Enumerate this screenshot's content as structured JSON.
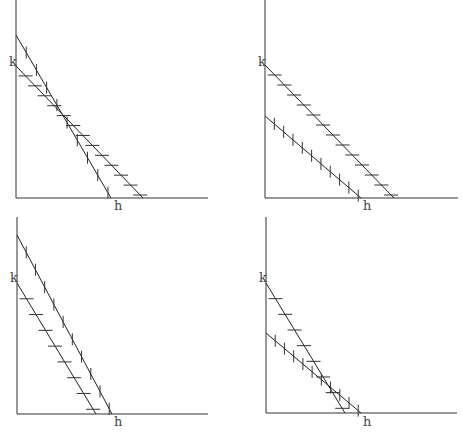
{
  "figure": {
    "colors": {
      "background": "#ffffff",
      "axis": "#333333",
      "line": "#222222",
      "label": "#444444"
    },
    "panels": [
      {
        "id": "top-left",
        "axes": {
          "origin": [
            16,
            198
          ],
          "y_top": 0,
          "x_right": 208
        },
        "labels": {
          "k": {
            "text": "k",
            "pos": [
              9,
              66
            ]
          },
          "h": {
            "text": "h",
            "pos": [
              114,
              210
            ]
          }
        },
        "lines": [
          {
            "name": "tick-line",
            "from": [
              16,
              35
            ],
            "to": [
              111,
              198
            ],
            "hatch": "tick",
            "marks": 9
          },
          {
            "name": "dash-line",
            "from": [
              16,
              66
            ],
            "to": [
              143,
              198
            ],
            "hatch": "dash",
            "marks": 13
          }
        ]
      },
      {
        "id": "top-right",
        "axes": {
          "origin": [
            265,
            198
          ],
          "y_top": 0,
          "x_right": 458
        },
        "labels": {
          "k": {
            "text": "k",
            "pos": [
              258,
              66
            ]
          },
          "h": {
            "text": "h",
            "pos": [
              363,
              210
            ]
          }
        },
        "lines": [
          {
            "name": "dash-line",
            "from": [
              265,
              65
            ],
            "to": [
              394,
              198
            ],
            "hatch": "dash",
            "marks": 13
          },
          {
            "name": "tick-line",
            "from": [
              265,
              116
            ],
            "to": [
              361,
              198
            ],
            "hatch": "tick",
            "marks": 10
          }
        ]
      },
      {
        "id": "bottom-left",
        "axes": {
          "origin": [
            17,
            414
          ],
          "y_top": 217,
          "x_right": 208
        },
        "labels": {
          "k": {
            "text": "k",
            "pos": [
              10,
              282
            ]
          },
          "h": {
            "text": "h",
            "pos": [
              114,
              426
            ]
          }
        },
        "lines": [
          {
            "name": "tick-line",
            "from": [
              17,
              235
            ],
            "to": [
              112,
              414
            ],
            "hatch": "tick",
            "marks": 10
          },
          {
            "name": "dash-line",
            "from": [
              17,
              283
            ],
            "to": [
              96,
              414
            ],
            "hatch": "dash",
            "marks": 8
          }
        ]
      },
      {
        "id": "bottom-right",
        "axes": {
          "origin": [
            266,
            413
          ],
          "y_top": 217,
          "x_right": 457
        },
        "labels": {
          "k": {
            "text": "k",
            "pos": [
              259,
              282
            ]
          },
          "h": {
            "text": "h",
            "pos": [
              363,
              426
            ]
          }
        },
        "lines": [
          {
            "name": "dash-line",
            "from": [
              266,
              283
            ],
            "to": [
              345,
              413
            ],
            "hatch": "dash",
            "marks": 8
          },
          {
            "name": "tick-line",
            "from": [
              266,
              333
            ],
            "to": [
              361,
              413
            ],
            "hatch": "tick",
            "marks": 10
          }
        ]
      }
    ]
  }
}
